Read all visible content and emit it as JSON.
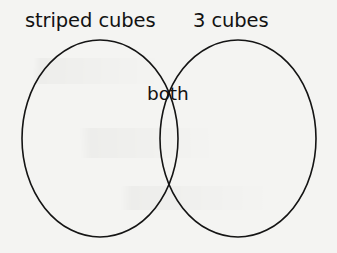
{
  "figure": {
    "type": "venn-diagram",
    "background_color": "#f4f4f2",
    "stroke_color": "#141414",
    "text_color": "#121212"
  },
  "labels": {
    "left_set": "striped cubes",
    "right_set": "3 cubes",
    "intersection": "both"
  },
  "chart_data": {
    "type": "diagram",
    "subtype": "venn-2-set",
    "title": "",
    "sets": [
      {
        "name": "striped cubes",
        "label_position": "top-left",
        "cx": 100,
        "cy": 138.5,
        "rx": 78,
        "ry": 98.5
      },
      {
        "name": "3 cubes",
        "label_position": "top-right",
        "cx": 238,
        "cy": 138.5,
        "rx": 78,
        "ry": 98.5
      }
    ],
    "regions": [
      {
        "name": "left-only",
        "label": "",
        "value": null
      },
      {
        "name": "intersection",
        "label": "both",
        "value": null
      },
      {
        "name": "right-only",
        "label": "",
        "value": null
      }
    ],
    "intersection_points": [
      {
        "x": 170,
        "y": 58
      },
      {
        "x": 170,
        "y": 218
      }
    ],
    "legend": "none",
    "grid": false
  }
}
